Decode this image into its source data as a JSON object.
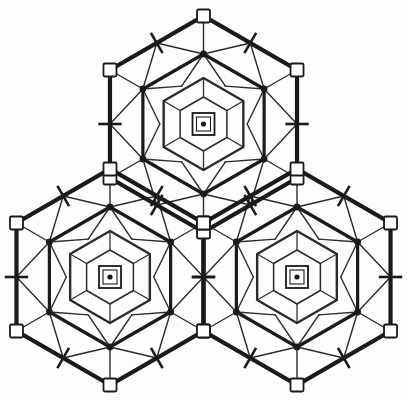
{
  "figure": {
    "background_color": "#fdfdfc",
    "ink_color": "#1a1a1a",
    "thin_color": "#2b2b2b",
    "unit_count": 3
  },
  "geometry": {
    "viewbox": "0 0 407 401",
    "hex_radius": 108,
    "unit_centers": [
      {
        "name": "top-unit",
        "cx": 203.5,
        "cy": 124.0
      },
      {
        "name": "bottom-left-unit",
        "cx": 110.0,
        "cy": 277.0
      },
      {
        "name": "bottom-right-unit",
        "cx": 297.0,
        "cy": 277.0
      }
    ],
    "ring_radii": {
      "outer_hexagon": 108,
      "node_ring": 70,
      "mid_hexagon": 46,
      "inner_hexagon": 27
    },
    "center_symbol": {
      "outer_square_size": 22,
      "inner_square_size": 14,
      "dot_radius": 2.6
    },
    "vertex_square_size": 13,
    "node_dot_radius": 3.4,
    "edge_tick_length": 26
  },
  "styles": {
    "outer_edge_width": 4.2,
    "node_ring_width": 3.2,
    "mid_ring_width": 2.4,
    "inner_ring_width": 1.5,
    "spoke_width": 1.4,
    "tick_width": 2.6,
    "square_stroke_width": 1.8
  },
  "legend": {
    "corner_square_label": "open square node",
    "center_symbol_label": "three-fold axis symbol",
    "node_dot_label": "filled vertex node",
    "tick_label": "edge tick mark"
  }
}
